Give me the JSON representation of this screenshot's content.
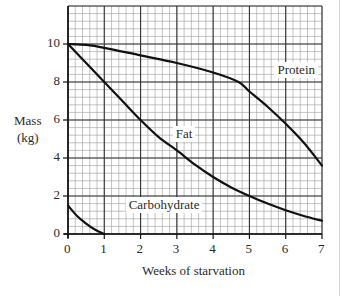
{
  "chart_data": {
    "type": "line",
    "title": "",
    "xlabel": "Weeks of starvation",
    "ylabel": "Mass (kg)",
    "ylabel_lines": [
      "Mass",
      "(kg)"
    ],
    "xlim": [
      0,
      7
    ],
    "ylim": [
      0,
      12
    ],
    "xticks": [
      0,
      1,
      2,
      3,
      4,
      5,
      6,
      7
    ],
    "yticks": [
      0,
      2,
      4,
      6,
      8,
      10
    ],
    "grid": true,
    "legend": "inline labels",
    "series": [
      {
        "name": "Protein",
        "x": [
          0,
          0.5,
          1,
          2,
          3,
          4,
          4.7,
          5,
          5.5,
          6,
          6.5,
          7
        ],
        "y": [
          10,
          9.95,
          9.8,
          9.4,
          9.0,
          8.5,
          8.0,
          7.5,
          6.7,
          5.8,
          4.8,
          3.6
        ],
        "label_pos": [
          5.8,
          8.6
        ]
      },
      {
        "name": "Fat",
        "x": [
          0,
          0.5,
          1,
          1.5,
          2,
          2.5,
          3,
          3.5,
          4,
          4.5,
          5,
          5.5,
          6,
          6.5,
          7
        ],
        "y": [
          10,
          9.0,
          8.0,
          7.0,
          6.0,
          5.1,
          4.4,
          3.65,
          3.0,
          2.45,
          2.0,
          1.6,
          1.25,
          0.95,
          0.7
        ],
        "label_pos": [
          3.0,
          5.2
        ]
      },
      {
        "name": "Carbohydrate",
        "x": [
          0,
          0.25,
          0.5,
          0.75,
          1
        ],
        "y": [
          1.5,
          0.95,
          0.55,
          0.22,
          0
        ],
        "label_pos": [
          1.7,
          1.5
        ]
      }
    ]
  }
}
